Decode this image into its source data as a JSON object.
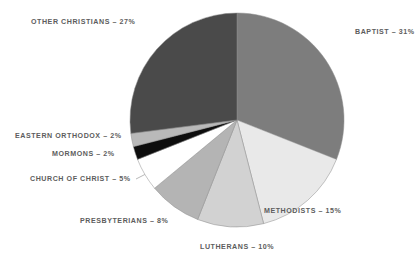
{
  "chart_data": {
    "type": "pie",
    "title": "",
    "subtitle": "",
    "xlabel": "",
    "ylabel": "",
    "legend_position": "none",
    "grid": false,
    "units": "percent",
    "total": 100,
    "categories": [
      "Baptist",
      "Methodists",
      "Lutherans",
      "Presbyterians",
      "Church of Christ",
      "Mormons",
      "Eastern Orthodox",
      "Other Christians"
    ],
    "values": [
      31,
      15,
      10,
      8,
      5,
      2,
      2,
      27
    ],
    "slices": [
      {
        "name": "Baptist",
        "value": 31,
        "label": "Baptist – 31%",
        "color": "#7d7d7d",
        "start_angle": 0,
        "end_angle": 111.6,
        "label_x": 355,
        "label_y": 33,
        "label_align": "left"
      },
      {
        "name": "Methodists",
        "value": 15,
        "label": "Methodists – 15%",
        "color": "#e9e9e9",
        "start_angle": 111.6,
        "end_angle": 165.6,
        "label_x": 341,
        "label_y": 212,
        "label_align": "right"
      },
      {
        "name": "Lutherans",
        "value": 10,
        "label": "Lutherans – 10%",
        "color": "#d2d2d2",
        "start_angle": 165.6,
        "end_angle": 201.6,
        "label_x": 237,
        "label_y": 248,
        "label_align": "center"
      },
      {
        "name": "Presbyterians",
        "value": 8,
        "label": "Presbyterians – 8%",
        "color": "#b4b4b4",
        "start_angle": 201.6,
        "end_angle": 230.4,
        "label_x": 168,
        "label_y": 222,
        "label_align": "right"
      },
      {
        "name": "Church of Christ",
        "value": 5,
        "label": "Church of Christ – 5%",
        "color": "#ffffff",
        "start_angle": 230.4,
        "end_angle": 248.4,
        "label_x": 131,
        "label_y": 180,
        "label_align": "right"
      },
      {
        "name": "Mormons",
        "value": 2,
        "label": "Mormons – 2%",
        "color": "#0d0d0d",
        "start_angle": 248.4,
        "end_angle": 255.6,
        "label_x": 115,
        "label_y": 155,
        "label_align": "right"
      },
      {
        "name": "Eastern Orthodox",
        "value": 2,
        "label": "Eastern Orthodox – 2%",
        "color": "#b9b9b9",
        "start_angle": 255.6,
        "end_angle": 262.8,
        "label_x": 122,
        "label_y": 137,
        "label_align": "right"
      },
      {
        "name": "Other Christians",
        "value": 27,
        "label": "Other Christians – 27%",
        "color": "#4a4a4a",
        "start_angle": 262.8,
        "end_angle": 360,
        "label_x": 31,
        "label_y": 23,
        "label_align": "left"
      }
    ],
    "geometry": {
      "center_x": 237,
      "center_y": 120,
      "radius": 107
    },
    "background_color": "#ffffff",
    "label_color": "#5d5d5d"
  }
}
